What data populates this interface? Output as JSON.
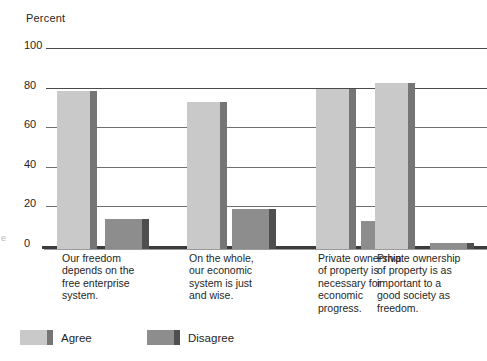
{
  "axis_title": "Percent",
  "margin_artifact": "e",
  "y_ticks": [
    "100",
    "80",
    "60",
    "40",
    "20",
    "0"
  ],
  "categories": [
    "Our freedom\ndepends on the\nfree enterprise\nsystem.",
    "On the whole,\nour economic\nsystem is just\nand wise.",
    "Private ownership\nof property is\nnecessary for\neconomic\nprogress.",
    "Private ownership\nof property is as\nimportant to a\ngood society as\nfreedom."
  ],
  "legend": [
    {
      "label": "Agree",
      "color": "#c9c9c9"
    },
    {
      "label": "Disagree",
      "color": "#8d8d8d"
    }
  ],
  "colors": {
    "agree_face": "#c9c9c9",
    "agree_side": "#757575",
    "disagree_face": "#8d8d8d",
    "disagree_side": "#4e4e4e",
    "gridline": "#6e6e6e",
    "baseline": "#3b3b3b",
    "text": "#1f1f1f",
    "background": "#ffffff"
  },
  "chart_data": {
    "type": "bar",
    "title": "",
    "subtitle": "",
    "xlabel": "",
    "ylabel": "Percent",
    "ylim": [
      0,
      100
    ],
    "yticks": [
      0,
      20,
      40,
      60,
      80,
      100
    ],
    "grid": true,
    "legend_position": "bottom-left",
    "categories": [
      "Our freedom depends on the free enterprise system.",
      "On the whole, our economic system is just and wise.",
      "Private ownership of property is necessary for economic progress.",
      "Private ownership of property is as important to a good society as freedom."
    ],
    "series": [
      {
        "name": "Agree",
        "values": [
          80,
          74,
          81,
          84
        ]
      },
      {
        "name": "Disagree",
        "values": [
          15,
          20,
          14,
          3
        ]
      }
    ]
  }
}
